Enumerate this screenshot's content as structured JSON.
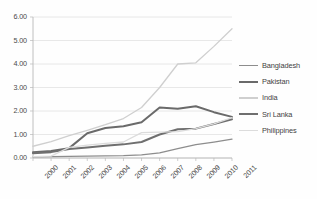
{
  "chart_data": {
    "type": "line",
    "title": "",
    "subtitle": "",
    "xlabel": "",
    "ylabel": "",
    "categories": [
      "2000",
      "2001",
      "2002",
      "2003",
      "2004",
      "2005",
      "2006",
      "2007",
      "2008",
      "2009",
      "2010",
      "2011"
    ],
    "x": [
      2000,
      2001,
      2002,
      2003,
      2004,
      2005,
      2006,
      2007,
      2008,
      2009,
      2010,
      2011
    ],
    "ylim": [
      0.0,
      6.0
    ],
    "ytick_values": [
      0.0,
      1.0,
      2.0,
      3.0,
      4.0,
      5.0,
      6.0
    ],
    "ytick_labels": [
      "0.00",
      "1.00",
      "2.00",
      "3.00",
      "4.00",
      "5.00",
      "6.00"
    ],
    "xtick_labels": [
      "2000",
      "2001",
      "2002",
      "2003",
      "2004",
      "2005",
      "2006",
      "2007",
      "2008",
      "2009",
      "2010",
      "2011"
    ],
    "xtick_rotation": -45,
    "grid": "horizontal",
    "legend_position": "right",
    "series": [
      {
        "name": "Bangladesh",
        "color": "#8d8d8d",
        "width": 1.3,
        "values": [
          0.05,
          0.06,
          0.07,
          0.08,
          0.09,
          0.1,
          0.13,
          0.22,
          0.4,
          0.57,
          0.68,
          0.8
        ]
      },
      {
        "name": "Pakistan",
        "color": "#6a6a6a",
        "width": 2.0,
        "values": [
          0.25,
          0.3,
          0.42,
          1.05,
          1.28,
          1.35,
          1.52,
          2.15,
          2.1,
          2.2,
          1.95,
          1.75
        ]
      },
      {
        "name": "India",
        "color": "#cfcfcf",
        "width": 1.3,
        "values": [
          0.5,
          0.7,
          0.95,
          1.18,
          1.42,
          1.68,
          2.15,
          3.0,
          4.0,
          4.05,
          4.75,
          5.5
        ]
      },
      {
        "name": "Sri Lanka",
        "color": "#6f6f6f",
        "width": 2.0,
        "values": [
          0.2,
          0.25,
          0.38,
          0.45,
          0.52,
          0.58,
          0.68,
          1.0,
          1.22,
          1.25,
          1.45,
          1.65
        ]
      },
      {
        "name": "Philippines",
        "color": "#dcdcdc",
        "width": 1.3,
        "values": [
          0.06,
          0.08,
          0.45,
          0.55,
          0.62,
          0.68,
          1.08,
          1.1,
          1.12,
          1.25,
          1.45,
          1.72
        ]
      }
    ]
  },
  "axis": {
    "line_color": "#b9b9b9",
    "grid_color": "#e2e2e2",
    "tick_text_color": "#4a4a4a"
  }
}
